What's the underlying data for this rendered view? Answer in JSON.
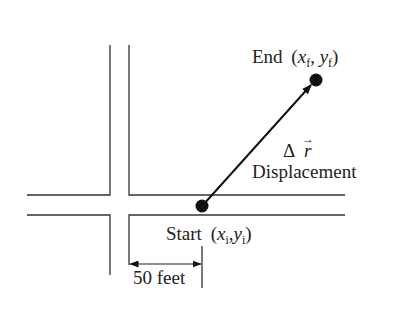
{
  "diagram": {
    "end_label": {
      "word": "End",
      "open": "(",
      "x": "x",
      "x_sub": "f",
      "comma": ", ",
      "y": "y",
      "y_sub": "f",
      "close": ")"
    },
    "start_label": {
      "word": "Start",
      "open": "(",
      "x": "x",
      "x_sub": "i",
      "comma": ",",
      "y": "y",
      "y_sub": "i",
      "close": ")"
    },
    "vector_symbol": {
      "delta": "Δ",
      "r": "r",
      "arrow": "→"
    },
    "vector_name": "Displacement",
    "dimension_label": "50 feet",
    "colors": {
      "line": "#333333",
      "dot": "#111111",
      "text": "#222222"
    }
  }
}
